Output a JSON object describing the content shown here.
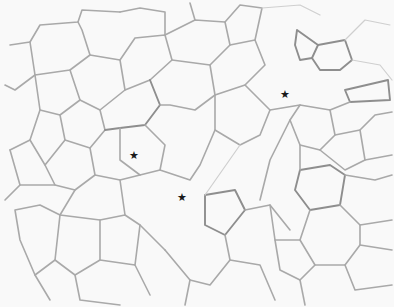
{
  "image": {
    "description": "Light micrograph of tissue cross-section showing polygonal cell outlines",
    "background_color": "#f9f9f9",
    "outline_color": "#a9a9a9",
    "width": 394,
    "height": 307
  },
  "markers": [
    {
      "symbol": "★",
      "x": 285,
      "y": 94
    },
    {
      "symbol": "★",
      "x": 134,
      "y": 155
    },
    {
      "symbol": "★",
      "x": 182,
      "y": 197
    }
  ]
}
